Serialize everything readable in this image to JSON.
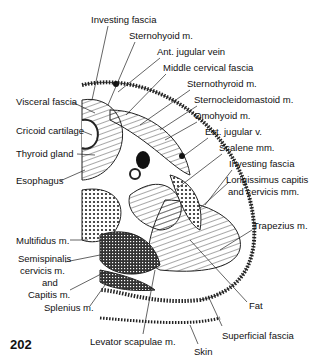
{
  "figure": {
    "page_number": "202",
    "labels": [
      {
        "id": "investing-fascia-top",
        "text": "Investing fascia",
        "x": 91,
        "y": 14
      },
      {
        "id": "sternohyoid",
        "text": "Sternohyoid m.",
        "x": 129,
        "y": 30
      },
      {
        "id": "ant-jugular",
        "text": "Ant. jugular vein",
        "x": 157,
        "y": 46
      },
      {
        "id": "middle-cervical-fascia",
        "text": "Middle cervical fascia",
        "x": 163,
        "y": 62
      },
      {
        "id": "sternothyroid",
        "text": "Sternothyroid m.",
        "x": 187,
        "y": 78
      },
      {
        "id": "scm",
        "text": "Sternocleidomastoid m.",
        "x": 194,
        "y": 94
      },
      {
        "id": "omohyoid",
        "text": "Omohyoid m.",
        "x": 194,
        "y": 110
      },
      {
        "id": "ext-jugular",
        "text": "Ext. jugular v.",
        "x": 205,
        "y": 126
      },
      {
        "id": "scalene",
        "text": "Scalene mm.",
        "x": 219,
        "y": 142
      },
      {
        "id": "investing-fascia-mid",
        "text": "Investing fascia",
        "x": 229,
        "y": 158
      },
      {
        "id": "longissimus-1",
        "text": "Longissimus capitis",
        "x": 226,
        "y": 174
      },
      {
        "id": "longissimus-2",
        "text": "and cervicis mm.",
        "x": 228,
        "y": 186
      },
      {
        "id": "trapezius",
        "text": "Trapezius m.",
        "x": 253,
        "y": 220
      },
      {
        "id": "visceral-fascia",
        "text": "Visceral fascia",
        "x": 16,
        "y": 96
      },
      {
        "id": "cricoid",
        "text": "Cricoid cartilage",
        "x": 16,
        "y": 125
      },
      {
        "id": "thyroid",
        "text": "Thyroid gland",
        "x": 16,
        "y": 148
      },
      {
        "id": "esophagus",
        "text": "Esophagus",
        "x": 16,
        "y": 175
      },
      {
        "id": "multifidus",
        "text": "Multifidus m.",
        "x": 16,
        "y": 235
      },
      {
        "id": "semispinalis-1",
        "text": "Semispinalis",
        "x": 18,
        "y": 253
      },
      {
        "id": "semispinalis-2",
        "text": "cervicis m.",
        "x": 20,
        "y": 265
      },
      {
        "id": "semispinalis-3",
        "text": "and",
        "x": 42,
        "y": 277
      },
      {
        "id": "semispinalis-4",
        "text": "Capitis m.",
        "x": 28,
        "y": 289
      },
      {
        "id": "splenius",
        "text": "Splenius m.",
        "x": 44,
        "y": 302
      },
      {
        "id": "fat",
        "text": "Fat",
        "x": 249,
        "y": 300
      },
      {
        "id": "superficial-fascia",
        "text": "Superficial fascia",
        "x": 222,
        "y": 330
      },
      {
        "id": "levator",
        "text": "Levator scapulae m.",
        "x": 90,
        "y": 336
      },
      {
        "id": "skin",
        "text": "Skin",
        "x": 194,
        "y": 346
      }
    ]
  }
}
